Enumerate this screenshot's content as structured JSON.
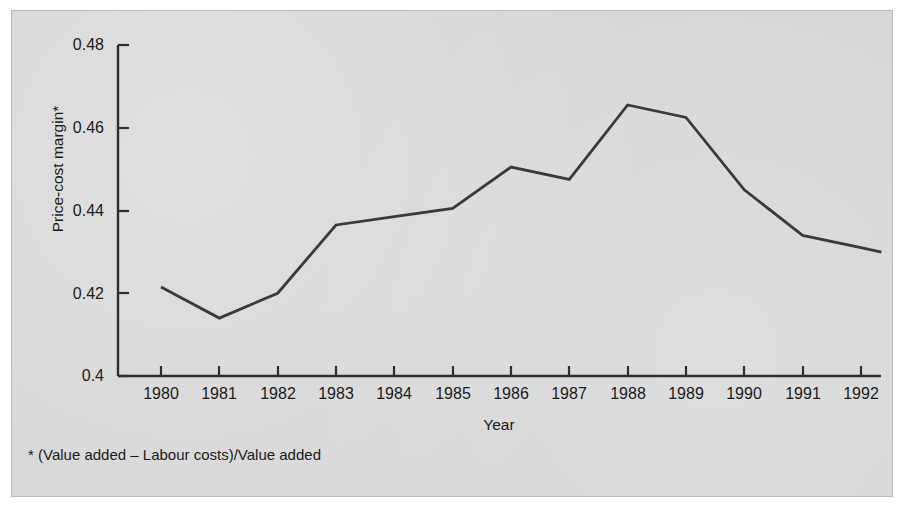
{
  "chart_data": {
    "type": "line",
    "title": "",
    "xlabel": "Year",
    "ylabel": "Price-cost margin*",
    "categories": [
      "1980",
      "1981",
      "1982",
      "1983",
      "1984",
      "1985",
      "1986",
      "1987",
      "1988",
      "1989",
      "1990",
      "1991",
      "1992"
    ],
    "x": [
      1980,
      1981,
      1982,
      1983,
      1984,
      1985,
      1986,
      1987,
      1988,
      1989,
      1990,
      1991,
      1992
    ],
    "values": [
      0.4215,
      0.414,
      0.42,
      0.4365,
      0.4385,
      0.4405,
      0.4505,
      0.4475,
      0.4655,
      0.4625,
      0.445,
      0.434,
      0.431
    ],
    "series": [
      {
        "name": "Price-cost margin",
        "values": [
          0.4215,
          0.414,
          0.42,
          0.4365,
          0.4385,
          0.4405,
          0.4505,
          0.4475,
          0.4655,
          0.4625,
          0.445,
          0.434,
          0.431
        ]
      }
    ],
    "ylim": [
      0.4,
      0.48
    ],
    "yticks": [
      0.4,
      0.42,
      0.44,
      0.46,
      0.48
    ],
    "ytick_labels": [
      "0.4",
      "0.42",
      "0.44",
      "0.46",
      "0.48"
    ],
    "xlim": [
      1980,
      1992.35
    ],
    "grid": false,
    "legend": false,
    "line_color": "#3a3a3a",
    "background_color": "#d7d7d7"
  },
  "axis": {
    "y_label": "Price-cost margin*",
    "x_label": "Year",
    "y_ticks": [
      "0.48",
      "0.46",
      "0.44",
      "0.42",
      "0.4"
    ],
    "x_ticks": [
      "1980",
      "1981",
      "1982",
      "1983",
      "1984",
      "1985",
      "1986",
      "1987",
      "1988",
      "1989",
      "1990",
      "1991",
      "1992"
    ]
  },
  "footnote": {
    "text": "* (Value added – Labour costs)/Value added"
  }
}
